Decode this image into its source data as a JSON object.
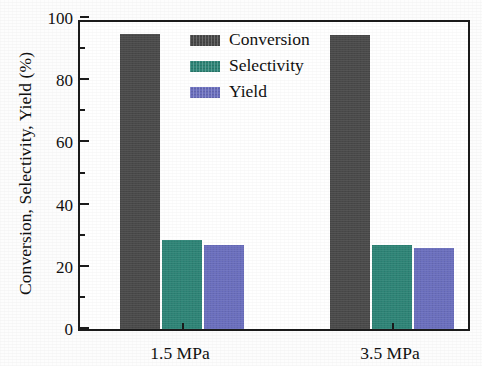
{
  "chart_data": {
    "type": "bar",
    "title": "",
    "subtitle": "",
    "xlabel": "",
    "ylabel": "Conversion, Selectivity, Yield (%)",
    "categories": [
      "1.5 MPa",
      "3.5 MPa"
    ],
    "series": [
      {
        "name": "Conversion",
        "values": [
          95,
          94.5
        ],
        "color": "#4A4A4A"
      },
      {
        "name": "Selectivity",
        "values": [
          28.5,
          27
        ],
        "color": "#2E8577"
      },
      {
        "name": "Yield",
        "values": [
          27,
          26
        ],
        "color": "#6B6FBF"
      }
    ],
    "ylim": [
      0,
      100
    ],
    "y_major_ticks": [
      0,
      20,
      40,
      60,
      80,
      100
    ],
    "y_minor_ticks": [
      10,
      30,
      50,
      70,
      90
    ],
    "y_tick_labels": [
      "0",
      "20",
      "40",
      "60",
      "80",
      "100"
    ],
    "grid": false,
    "legend_position": "upper-center-left",
    "legend_entries": [
      "Conversion",
      "Selectivity",
      "Yield"
    ],
    "axis_color": "#1b1b1b",
    "background_color": "#ffffff"
  },
  "axes": {
    "y_title": "Conversion, Selectivity, Yield (%)",
    "y_labels": [
      "100",
      "80",
      "60",
      "40",
      "20",
      "0"
    ],
    "x_labels": [
      "1.5 MPa",
      "3.5 MPa"
    ]
  },
  "legend": {
    "items": [
      {
        "label": "Conversion",
        "color": "#4A4A4A"
      },
      {
        "label": "Selectivity",
        "color": "#2E8577"
      },
      {
        "label": "Yield",
        "color": "#6B6FBF"
      }
    ]
  }
}
